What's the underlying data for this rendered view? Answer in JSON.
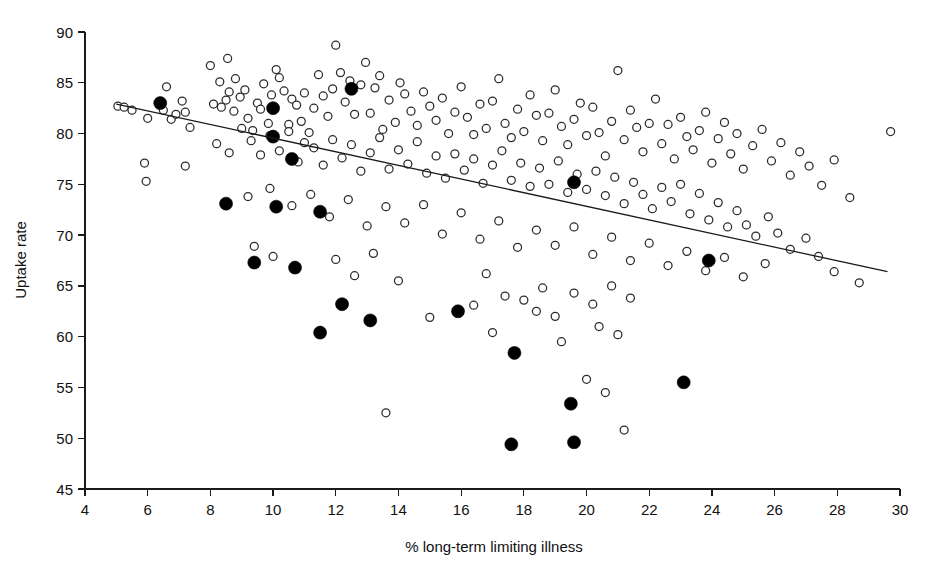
{
  "chart_data": {
    "type": "scatter",
    "title": "",
    "xlabel": "% long-term limiting illness",
    "ylabel": "Uptake rate",
    "xlim": [
      4,
      30
    ],
    "ylim": [
      45,
      90
    ],
    "xticks": [
      4,
      6,
      8,
      10,
      12,
      14,
      16,
      18,
      20,
      22,
      24,
      26,
      28,
      30
    ],
    "yticks": [
      45,
      50,
      55,
      60,
      65,
      70,
      75,
      80,
      85,
      90
    ],
    "grid": false,
    "legend": "none",
    "colors": {
      "open_marker_stroke": "#2b2b2b",
      "open_marker_fill": "#ffffff",
      "filled_marker": "#000000",
      "trend_line": "#1a1a1a",
      "axis": "#1a1a1a",
      "background": "#ffffff"
    },
    "trend_line": {
      "name": "fitted regression line",
      "x_start": 5.0,
      "y_start": 82.9,
      "x_end": 29.6,
      "y_end": 66.4
    },
    "series": [
      {
        "name": "Open circles (all wards)",
        "marker": "open-circle",
        "marker_radius_px": 4.0,
        "points": [
          [
            5.05,
            82.7
          ],
          [
            5.25,
            82.6
          ],
          [
            5.5,
            82.3
          ],
          [
            6.0,
            81.5
          ],
          [
            6.35,
            83.0
          ],
          [
            6.5,
            82.3
          ],
          [
            6.6,
            84.6
          ],
          [
            6.75,
            81.4
          ],
          [
            6.9,
            81.9
          ],
          [
            7.1,
            83.2
          ],
          [
            7.2,
            82.1
          ],
          [
            7.35,
            80.6
          ],
          [
            5.9,
            77.1
          ],
          [
            5.95,
            75.3
          ],
          [
            7.2,
            76.8
          ],
          [
            8.0,
            86.7
          ],
          [
            8.3,
            85.1
          ],
          [
            8.55,
            87.4
          ],
          [
            8.8,
            85.4
          ],
          [
            8.1,
            82.9
          ],
          [
            8.35,
            82.6
          ],
          [
            8.5,
            83.3
          ],
          [
            8.6,
            84.1
          ],
          [
            8.75,
            82.2
          ],
          [
            8.95,
            83.6
          ],
          [
            9.1,
            84.3
          ],
          [
            9.2,
            81.5
          ],
          [
            9.35,
            80.3
          ],
          [
            9.5,
            83.0
          ],
          [
            9.6,
            82.4
          ],
          [
            9.7,
            84.9
          ],
          [
            9.85,
            81.0
          ],
          [
            9.95,
            83.8
          ],
          [
            10.1,
            86.3
          ],
          [
            10.2,
            85.5
          ],
          [
            10.35,
            84.2
          ],
          [
            10.5,
            80.9
          ],
          [
            10.6,
            83.4
          ],
          [
            10.75,
            82.8
          ],
          [
            10.9,
            81.2
          ],
          [
            11.0,
            84.0
          ],
          [
            11.15,
            80.1
          ],
          [
            11.3,
            82.5
          ],
          [
            11.45,
            85.8
          ],
          [
            11.6,
            83.7
          ],
          [
            11.75,
            81.7
          ],
          [
            11.9,
            84.4
          ],
          [
            12.0,
            88.7
          ],
          [
            12.15,
            86.0
          ],
          [
            12.3,
            83.1
          ],
          [
            12.45,
            85.2
          ],
          [
            12.6,
            81.9
          ],
          [
            12.8,
            84.8
          ],
          [
            12.95,
            87.0
          ],
          [
            13.1,
            82.0
          ],
          [
            13.25,
            84.5
          ],
          [
            13.4,
            85.7
          ],
          [
            13.5,
            80.4
          ],
          [
            13.7,
            83.3
          ],
          [
            13.9,
            81.1
          ],
          [
            14.05,
            85.0
          ],
          [
            14.2,
            83.9
          ],
          [
            14.4,
            82.2
          ],
          [
            14.6,
            80.8
          ],
          [
            14.8,
            84.1
          ],
          [
            15.0,
            82.7
          ],
          [
            15.2,
            81.3
          ],
          [
            15.4,
            83.5
          ],
          [
            15.6,
            80.0
          ],
          [
            15.8,
            82.1
          ],
          [
            16.0,
            84.6
          ],
          [
            16.2,
            81.6
          ],
          [
            16.4,
            79.9
          ],
          [
            16.6,
            82.9
          ],
          [
            16.8,
            80.5
          ],
          [
            17.0,
            83.2
          ],
          [
            17.2,
            85.4
          ],
          [
            17.4,
            81.0
          ],
          [
            17.6,
            79.6
          ],
          [
            17.8,
            82.4
          ],
          [
            18.0,
            80.2
          ],
          [
            18.2,
            83.8
          ],
          [
            18.4,
            81.8
          ],
          [
            18.6,
            79.3
          ],
          [
            18.8,
            82.0
          ],
          [
            19.0,
            84.3
          ],
          [
            19.2,
            80.7
          ],
          [
            19.4,
            78.9
          ],
          [
            19.6,
            81.4
          ],
          [
            19.8,
            83.0
          ],
          [
            20.0,
            79.8
          ],
          [
            20.2,
            82.6
          ],
          [
            20.4,
            80.1
          ],
          [
            20.6,
            77.8
          ],
          [
            20.8,
            81.2
          ],
          [
            21.0,
            86.2
          ],
          [
            21.2,
            79.4
          ],
          [
            21.4,
            82.3
          ],
          [
            21.6,
            80.6
          ],
          [
            21.8,
            78.2
          ],
          [
            22.0,
            81.0
          ],
          [
            22.2,
            83.4
          ],
          [
            22.4,
            79.0
          ],
          [
            22.6,
            80.9
          ],
          [
            22.8,
            77.5
          ],
          [
            23.0,
            81.6
          ],
          [
            23.2,
            79.7
          ],
          [
            23.4,
            78.4
          ],
          [
            23.6,
            80.3
          ],
          [
            23.8,
            82.1
          ],
          [
            24.0,
            77.1
          ],
          [
            24.2,
            79.5
          ],
          [
            24.4,
            81.1
          ],
          [
            24.6,
            78.0
          ],
          [
            24.8,
            80.0
          ],
          [
            25.0,
            76.5
          ],
          [
            25.3,
            78.8
          ],
          [
            25.6,
            80.4
          ],
          [
            25.9,
            77.3
          ],
          [
            26.2,
            79.1
          ],
          [
            26.5,
            75.9
          ],
          [
            26.8,
            78.2
          ],
          [
            27.1,
            76.8
          ],
          [
            27.5,
            74.9
          ],
          [
            27.9,
            77.4
          ],
          [
            28.4,
            73.7
          ],
          [
            28.7,
            65.3
          ],
          [
            29.7,
            80.2
          ],
          [
            8.2,
            79.0
          ],
          [
            8.6,
            78.1
          ],
          [
            9.0,
            80.5
          ],
          [
            9.3,
            79.3
          ],
          [
            9.6,
            77.9
          ],
          [
            9.9,
            79.8
          ],
          [
            10.2,
            78.3
          ],
          [
            10.5,
            80.2
          ],
          [
            10.8,
            77.2
          ],
          [
            11.0,
            79.1
          ],
          [
            11.3,
            78.6
          ],
          [
            11.6,
            76.9
          ],
          [
            11.9,
            79.4
          ],
          [
            12.2,
            77.6
          ],
          [
            12.5,
            78.9
          ],
          [
            12.8,
            76.3
          ],
          [
            13.1,
            78.1
          ],
          [
            13.4,
            79.6
          ],
          [
            13.7,
            76.5
          ],
          [
            14.0,
            78.4
          ],
          [
            14.3,
            77.0
          ],
          [
            14.6,
            79.2
          ],
          [
            14.9,
            76.1
          ],
          [
            15.2,
            77.8
          ],
          [
            15.5,
            75.6
          ],
          [
            15.8,
            78.0
          ],
          [
            16.1,
            76.4
          ],
          [
            16.4,
            77.5
          ],
          [
            16.7,
            75.1
          ],
          [
            17.0,
            76.9
          ],
          [
            17.3,
            78.3
          ],
          [
            17.6,
            75.4
          ],
          [
            17.9,
            77.1
          ],
          [
            18.2,
            74.8
          ],
          [
            18.5,
            76.6
          ],
          [
            18.8,
            75.0
          ],
          [
            19.1,
            77.3
          ],
          [
            19.4,
            74.2
          ],
          [
            19.7,
            76.0
          ],
          [
            20.0,
            74.5
          ],
          [
            20.3,
            76.3
          ],
          [
            20.6,
            73.9
          ],
          [
            20.9,
            75.7
          ],
          [
            21.2,
            73.1
          ],
          [
            21.5,
            75.2
          ],
          [
            21.8,
            74.0
          ],
          [
            22.1,
            72.6
          ],
          [
            22.4,
            74.7
          ],
          [
            22.7,
            73.3
          ],
          [
            23.0,
            75.0
          ],
          [
            23.3,
            72.1
          ],
          [
            23.6,
            74.1
          ],
          [
            23.9,
            71.5
          ],
          [
            24.2,
            73.2
          ],
          [
            24.5,
            70.8
          ],
          [
            24.8,
            72.4
          ],
          [
            25.1,
            71.0
          ],
          [
            25.4,
            69.9
          ],
          [
            25.8,
            71.8
          ],
          [
            26.1,
            70.2
          ],
          [
            26.5,
            68.6
          ],
          [
            27.0,
            69.7
          ],
          [
            27.4,
            67.9
          ],
          [
            27.9,
            66.4
          ],
          [
            9.2,
            73.8
          ],
          [
            9.9,
            74.6
          ],
          [
            10.6,
            72.9
          ],
          [
            11.2,
            74.0
          ],
          [
            11.8,
            71.8
          ],
          [
            12.4,
            73.5
          ],
          [
            13.0,
            70.9
          ],
          [
            13.6,
            72.8
          ],
          [
            14.2,
            71.2
          ],
          [
            14.8,
            73.0
          ],
          [
            15.4,
            70.1
          ],
          [
            16.0,
            72.2
          ],
          [
            16.6,
            69.6
          ],
          [
            17.2,
            71.4
          ],
          [
            17.8,
            68.8
          ],
          [
            18.4,
            70.5
          ],
          [
            19.0,
            69.0
          ],
          [
            19.6,
            70.8
          ],
          [
            20.2,
            68.1
          ],
          [
            20.8,
            69.8
          ],
          [
            21.4,
            67.5
          ],
          [
            22.0,
            69.2
          ],
          [
            22.6,
            67.0
          ],
          [
            23.2,
            68.4
          ],
          [
            23.8,
            66.5
          ],
          [
            24.4,
            67.8
          ],
          [
            25.0,
            65.9
          ],
          [
            25.7,
            67.2
          ],
          [
            12.0,
            67.6
          ],
          [
            12.6,
            66.0
          ],
          [
            13.2,
            68.2
          ],
          [
            14.0,
            65.5
          ],
          [
            19.6,
            64.3
          ],
          [
            20.2,
            63.2
          ],
          [
            20.8,
            65.0
          ],
          [
            21.4,
            63.8
          ],
          [
            18.4,
            62.5
          ],
          [
            16.4,
            63.1
          ],
          [
            17.0,
            60.4
          ],
          [
            15.0,
            61.9
          ],
          [
            20.0,
            55.8
          ],
          [
            20.6,
            54.5
          ],
          [
            21.2,
            50.8
          ],
          [
            13.6,
            52.5
          ],
          [
            18.0,
            63.6
          ],
          [
            18.6,
            64.8
          ],
          [
            19.0,
            62.0
          ],
          [
            16.8,
            66.2
          ],
          [
            20.4,
            61.0
          ],
          [
            21.0,
            60.2
          ],
          [
            19.2,
            59.5
          ],
          [
            17.4,
            64.0
          ],
          [
            9.4,
            68.9
          ],
          [
            10.0,
            67.9
          ]
        ]
      },
      {
        "name": "Filled circles (intervention wards)",
        "marker": "filled-circle",
        "marker_radius_px": 6.5,
        "points": [
          [
            6.4,
            83.0
          ],
          [
            10.0,
            82.5
          ],
          [
            10.0,
            79.7
          ],
          [
            10.6,
            77.5
          ],
          [
            12.5,
            84.4
          ],
          [
            8.5,
            73.1
          ],
          [
            10.1,
            72.8
          ],
          [
            11.5,
            72.3
          ],
          [
            9.4,
            67.3
          ],
          [
            10.7,
            66.8
          ],
          [
            12.2,
            63.2
          ],
          [
            11.5,
            60.4
          ],
          [
            13.1,
            61.6
          ],
          [
            15.9,
            62.5
          ],
          [
            17.6,
            49.4
          ],
          [
            17.7,
            58.4
          ],
          [
            19.5,
            53.4
          ],
          [
            19.6,
            49.6
          ],
          [
            19.6,
            75.2
          ],
          [
            23.1,
            55.5
          ],
          [
            23.9,
            67.5
          ]
        ]
      }
    ]
  },
  "axis_titles": {
    "x": "% long-term limiting illness",
    "y": "Uptake rate"
  }
}
